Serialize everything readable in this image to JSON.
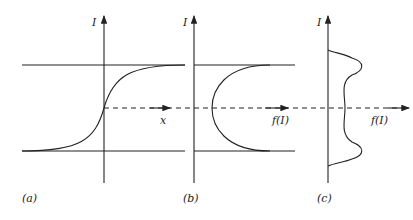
{
  "panels": [
    {
      "id": "a",
      "caption": "(a)",
      "axis_label": "I",
      "x_label": "x"
    },
    {
      "id": "b",
      "caption": "(b)",
      "axis_label": "I",
      "x_label": "f(I)"
    },
    {
      "id": "c",
      "caption": "(c)",
      "axis_label": "I",
      "x_label": "f(I)"
    }
  ],
  "colors": {
    "line": "#222222",
    "background": "#ffffff"
  }
}
